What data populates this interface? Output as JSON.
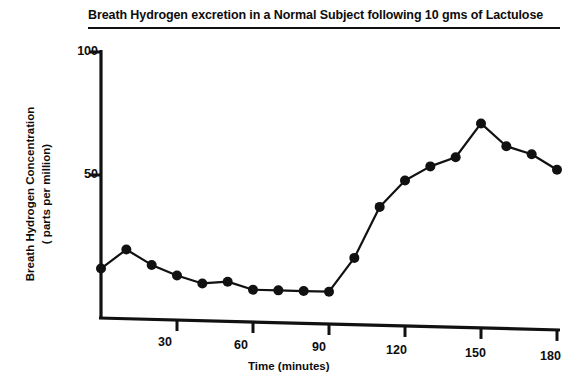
{
  "chart_data": {
    "type": "line",
    "title": "Breath Hydrogen excretion in a Normal Subject following 10 gms of Lactulose",
    "xlabel": "Time (minutes)",
    "ylabel": "Breath Hydrogen Concentration ( parts per million)",
    "ylabel_line1": "Breath Hydrogen Concentration",
    "ylabel_line2": "( parts per million)",
    "x": [
      0,
      10,
      20,
      30,
      40,
      50,
      60,
      70,
      80,
      90,
      100,
      110,
      120,
      130,
      140,
      150,
      160,
      170,
      180
    ],
    "values": [
      12,
      20,
      14,
      10,
      7,
      8,
      5,
      5,
      5,
      5,
      19,
      40,
      51,
      57,
      61,
      75,
      66,
      63,
      57
    ],
    "xlim": [
      0,
      180
    ],
    "ylim": [
      0,
      100
    ],
    "xticks": [
      30,
      60,
      90,
      120,
      150,
      180
    ],
    "xtick_labels": [
      "30",
      "60",
      "90",
      "120",
      "150",
      "180"
    ],
    "yticks": [
      50,
      100
    ],
    "ytick_labels": [
      "50",
      "100"
    ],
    "grid": false,
    "legend": false,
    "marker": "filled-circle",
    "line_color": "#111111",
    "marker_color": "#111111",
    "background": "#ffffff"
  }
}
